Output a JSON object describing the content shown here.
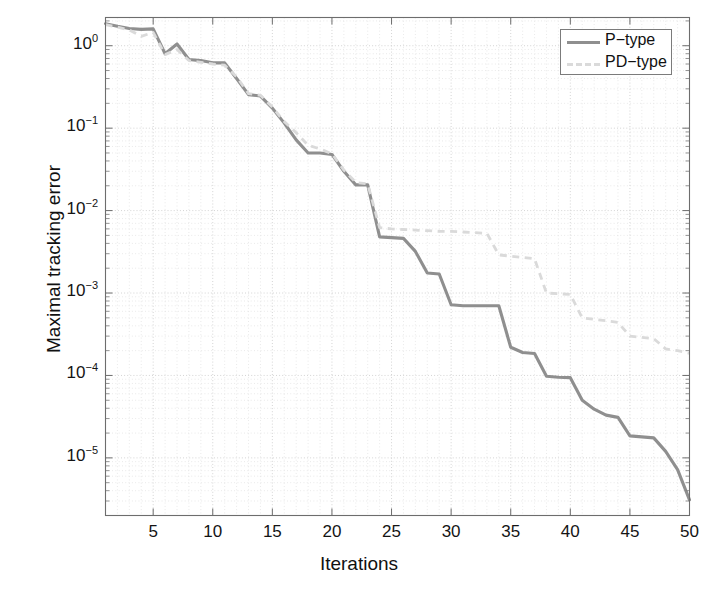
{
  "chart_data": {
    "type": "line",
    "title": "",
    "xlabel": "Iterations",
    "ylabel": "Maximal tracking error",
    "xlim": [
      1,
      50
    ],
    "ylim": [
      2e-06,
      2.2
    ],
    "yscale": "log",
    "xscale": "linear",
    "grid": true,
    "grid_style": "dotted",
    "legend_position": "top-right",
    "xticks": [
      5,
      10,
      15,
      20,
      25,
      30,
      35,
      40,
      45,
      50
    ],
    "xtick_labels": [
      "5",
      "10",
      "15",
      "20",
      "25",
      "30",
      "35",
      "40",
      "45",
      "50"
    ],
    "yticks": [
      1,
      0.1,
      0.01,
      0.001,
      0.0001,
      1e-05
    ],
    "ytick_labels": [
      "10^0",
      "10^-1",
      "10^-2",
      "10^-3",
      "10^-4",
      "10^-5"
    ],
    "ytick_mantissa": [
      "10",
      "10",
      "10",
      "10",
      "10",
      "10"
    ],
    "ytick_exponent": [
      "0",
      "-1",
      "-2",
      "-3",
      "-4",
      "-5"
    ],
    "colors": {
      "p_type": "#8f8f8f",
      "pd_type": "#dadada",
      "axis": "#6d6d6d",
      "grid_major": "#c9c9c9",
      "grid_minor": "#dcdcdc",
      "background": "#ffffff"
    },
    "x": [
      1,
      2,
      3,
      4,
      5,
      6,
      7,
      8,
      9,
      10,
      11,
      12,
      13,
      14,
      15,
      16,
      17,
      18,
      19,
      20,
      21,
      22,
      23,
      24,
      25,
      26,
      27,
      28,
      29,
      30,
      31,
      32,
      33,
      34,
      35,
      36,
      37,
      38,
      39,
      40,
      41,
      42,
      43,
      44,
      45,
      46,
      47,
      48,
      49,
      50
    ],
    "series": [
      {
        "name": "P-type",
        "style": "solid",
        "color": "#8f8f8f",
        "values": [
          1.85,
          1.72,
          1.62,
          1.58,
          1.6,
          0.8,
          1.05,
          0.68,
          0.66,
          0.62,
          0.62,
          0.4,
          0.255,
          0.245,
          0.175,
          0.115,
          0.072,
          0.05,
          0.05,
          0.048,
          0.03,
          0.0205,
          0.0205,
          0.0048,
          0.0047,
          0.0046,
          0.0032,
          0.00175,
          0.0017,
          0.00072,
          0.0007,
          0.0007,
          0.0007,
          0.0007,
          0.00022,
          0.00019,
          0.000185,
          9.8e-05,
          9.5e-05,
          9.4e-05,
          5e-05,
          3.9e-05,
          3.3e-05,
          3.1e-05,
          1.85e-05,
          1.8e-05,
          1.75e-05,
          1.2e-05,
          7.2e-06,
          3.1e-06
        ]
      },
      {
        "name": "PD-type",
        "style": "dashed",
        "color": "#dadada",
        "values": [
          1.8,
          1.68,
          1.55,
          1.3,
          1.45,
          0.78,
          0.9,
          0.66,
          0.63,
          0.6,
          0.58,
          0.42,
          0.262,
          0.25,
          0.18,
          0.12,
          0.088,
          0.062,
          0.056,
          0.049,
          0.031,
          0.022,
          0.021,
          0.0062,
          0.006,
          0.0059,
          0.0058,
          0.0057,
          0.0056,
          0.0056,
          0.0055,
          0.0054,
          0.0053,
          0.0029,
          0.0028,
          0.0027,
          0.0026,
          0.001,
          0.00098,
          0.00096,
          0.0005,
          0.00048,
          0.00046,
          0.00044,
          0.0003,
          0.00029,
          0.00028,
          0.00021,
          0.0002,
          0.000185
        ]
      }
    ]
  },
  "legend": {
    "entries": [
      {
        "label": "P−type",
        "style": "solid"
      },
      {
        "label": "PD−type",
        "style": "dashed"
      }
    ]
  },
  "axes": {
    "ylabel": "Maximal tracking error",
    "xlabel": "Iterations"
  }
}
